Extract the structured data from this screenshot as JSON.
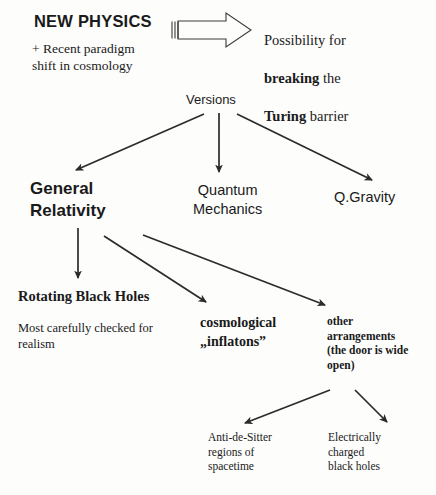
{
  "diagram": {
    "title": "NEW PHYSICS",
    "subtitle": "+ Recent paradigm\nshift in cosmology",
    "big_arrow_icon": "block-arrow-right-icon",
    "result_lines": {
      "line1": "Possibility for",
      "line2_bold": "breaking",
      "line2_rest": " the",
      "line3_bold": "Turing",
      "line3_rest": " barrier"
    },
    "branch_root": "Versions",
    "branches": [
      {
        "label": "General\nRelativity",
        "style": "sans-bold"
      },
      {
        "label": "Quantum\nMechanics",
        "style": "sans"
      },
      {
        "label": "Q.Gravity",
        "style": "sans"
      }
    ],
    "gr_children": [
      {
        "label": "Rotating Black Holes",
        "note": "Most carefully checked for\nrealism"
      },
      {
        "label": "cosmological\n„inflatons”"
      },
      {
        "label": "other\narrangements\n(the door is wide\nopen)"
      }
    ],
    "other_arrangement_children": [
      {
        "label": "Anti-de-Sitter\nregions of\nspacetime"
      },
      {
        "label": "Electrically\ncharged\nblack holes"
      }
    ],
    "colors": {
      "ink": "#1a1a1a",
      "background": "#fdfdfc",
      "stroke": "#2b2b2b"
    }
  }
}
